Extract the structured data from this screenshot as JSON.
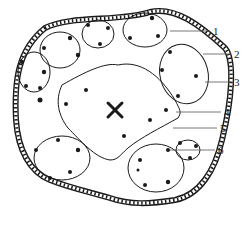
{
  "figure": {
    "type": "schematic cross-section",
    "colors": {
      "ink": "#1a1a1a",
      "leader": "#555555",
      "background": "#ffffff"
    }
  },
  "callouts": [
    {
      "id": "1",
      "label": "1",
      "x": 213,
      "y": 26
    },
    {
      "id": "2",
      "label": "2",
      "x": 234,
      "y": 49
    },
    {
      "id": "3",
      "label": "3",
      "x": 234,
      "y": 78
    },
    {
      "id": "4",
      "label": "4",
      "x": 224,
      "y": 108
    },
    {
      "id": "5",
      "label": "5",
      "x": 220,
      "y": 124
    },
    {
      "id": "6",
      "label": "6",
      "x": 218,
      "y": 146
    }
  ]
}
